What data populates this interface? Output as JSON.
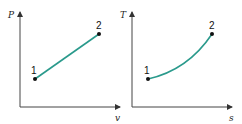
{
  "diagrams": [
    {
      "name": "Pv diagram",
      "y_axis_label": "P",
      "x_axis_label": "v",
      "points": [
        {
          "label": "1"
        },
        {
          "label": "2"
        }
      ],
      "process": "straight line from 1 to 2"
    },
    {
      "name": "Ts diagram",
      "y_axis_label": "T",
      "x_axis_label": "s",
      "points": [
        {
          "label": "1"
        },
        {
          "label": "2"
        }
      ],
      "process": "concave-up curve from 1 to 2"
    }
  ],
  "colors": {
    "curve": "#2a9a8c",
    "axis": "#444444",
    "point": "#111111"
  }
}
